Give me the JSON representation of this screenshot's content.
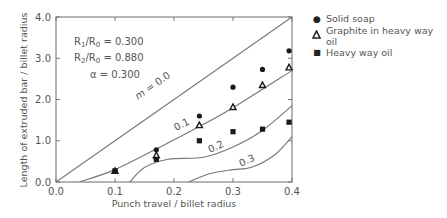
{
  "chart_data": {
    "type": "scatter",
    "title": "",
    "xlabel": "Punch travel / billet radius",
    "ylabel": "Length of extruded bar / billet radius",
    "xlim": [
      0.0,
      0.4
    ],
    "ylim": [
      0.0,
      4.0
    ],
    "xticks": [
      "0.0",
      "0.1",
      "0.2",
      "0.3",
      "0.4"
    ],
    "yticks": [
      "0.0",
      "1.0",
      "2.0",
      "3.0",
      "4.0"
    ],
    "grid": false,
    "legend_position": "right",
    "annotations": {
      "r1": "R1/R0 = 0.300",
      "r2": "R2/R0 = 0.880",
      "alpha": "α = 0.300"
    },
    "series": [
      {
        "name": "Solid soap",
        "marker": "circle",
        "x": [
          0.1,
          0.17,
          0.243,
          0.3,
          0.35,
          0.395
        ],
        "y": [
          0.27,
          0.78,
          1.6,
          2.3,
          2.73,
          3.18
        ]
      },
      {
        "name": "Graphite in heavy way oil",
        "marker": "triangle-open",
        "x": [
          0.1,
          0.17,
          0.243,
          0.3,
          0.35,
          0.395
        ],
        "y": [
          0.27,
          0.65,
          1.38,
          1.82,
          2.35,
          2.78
        ]
      },
      {
        "name": "Heavy way oil",
        "marker": "square",
        "x": [
          0.1,
          0.17,
          0.243,
          0.3,
          0.35,
          0.395
        ],
        "y": [
          0.27,
          0.55,
          1.0,
          1.22,
          1.28,
          1.45
        ]
      }
    ],
    "curves": [
      {
        "label": "m = 0.0",
        "x": [
          0.0,
          0.4
        ],
        "y": [
          0.0,
          4.0
        ]
      },
      {
        "label": "0.1",
        "x": [
          0.04,
          0.1,
          0.17,
          0.25,
          0.3,
          0.4
        ],
        "y": [
          0.0,
          0.3,
          0.8,
          1.4,
          1.8,
          2.7
        ]
      },
      {
        "label": "0.2",
        "x": [
          0.125,
          0.15,
          0.19,
          0.25,
          0.3,
          0.35,
          0.4
        ],
        "y": [
          0.0,
          0.35,
          0.55,
          0.6,
          0.85,
          1.25,
          1.85
        ]
      },
      {
        "label": "0.3",
        "x": [
          0.225,
          0.26,
          0.3,
          0.33,
          0.37,
          0.4
        ],
        "y": [
          0.0,
          0.2,
          0.3,
          0.35,
          0.65,
          1.1
        ]
      }
    ]
  },
  "legend": {
    "items": [
      {
        "label": "Solid soap",
        "marker": "●"
      },
      {
        "label": "Graphite in heavy way oil",
        "marker": "▲"
      },
      {
        "label": "Heavy way oil",
        "marker": "■"
      }
    ]
  },
  "labels": {
    "ann_r1_a": "R",
    "ann_r1_sub1": "1",
    "ann_r1_b": "/R",
    "ann_r1_sub0": "0",
    "ann_r1_val": " = 0.300",
    "ann_r2_a": "R",
    "ann_r2_sub2": "2",
    "ann_r2_b": "/R",
    "ann_r2_sub0": "0",
    "ann_r2_val": " = 0.880",
    "ann_alpha": "α = 0.300",
    "curve_m0": "m = 0.0",
    "curve_01": "0.1",
    "curve_02": "0.2",
    "curve_03": "0.3"
  }
}
